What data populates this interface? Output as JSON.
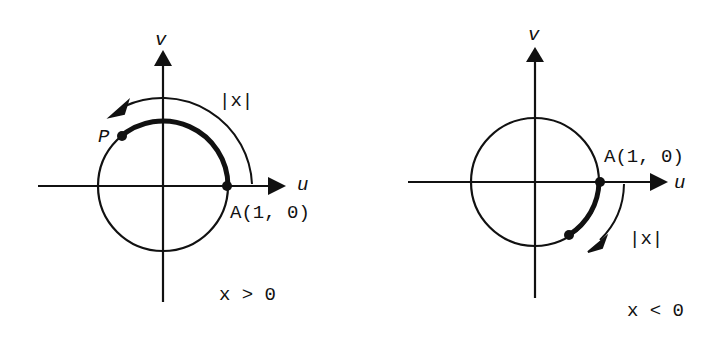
{
  "diagrams": [
    {
      "id": "positive",
      "axis_h_label": "u",
      "axis_v_label": "v",
      "point_a_label": "A(1, 0)",
      "point_p_label": "P",
      "arc_label": "|x|",
      "condition": "x > 0",
      "direction": "counterclockwise"
    },
    {
      "id": "negative",
      "axis_h_label": "u",
      "axis_v_label": "v",
      "point_a_label": "A(1, 0)",
      "arc_label": "|x|",
      "condition": "x < 0",
      "direction": "clockwise"
    }
  ],
  "colors": {
    "ink": "#111111",
    "background": "#ffffff"
  }
}
